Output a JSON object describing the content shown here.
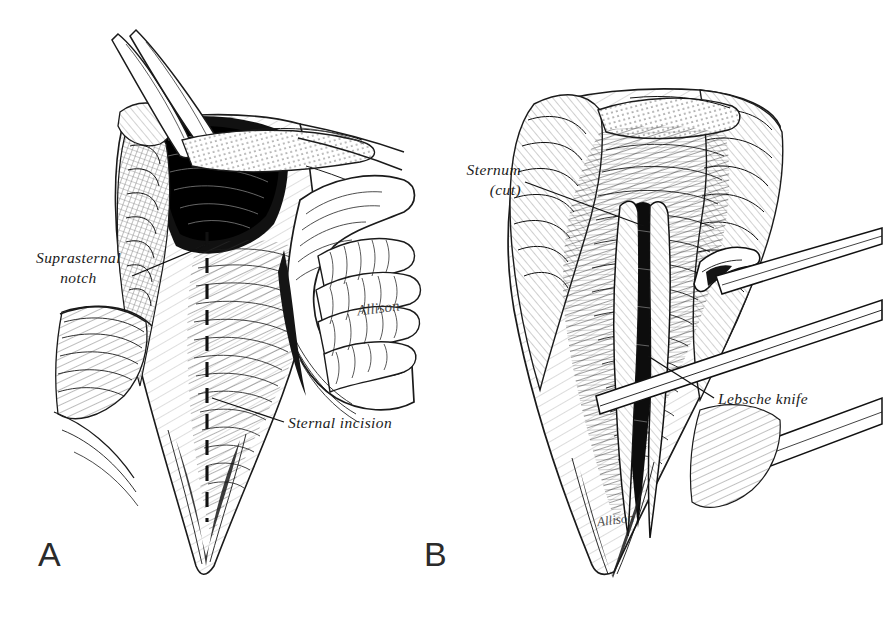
{
  "figure": {
    "medium": "pen-and-ink line drawing",
    "background_color": "#ffffff",
    "ink_color": "#1a1a1a",
    "panels": [
      {
        "letter": "A",
        "description": "Exposed sternum with surgeon's fist demonstrating blunt dissection of the retrosternal plane; dashed midline marks the planned sternal incision.",
        "annotations": [
          {
            "id": "suprasternal-notch",
            "text_lines": [
              "Suprasternal",
              "notch"
            ],
            "text": "Suprasternal notch"
          },
          {
            "id": "sternal-incision",
            "text_lines": [
              "Sternal  incision"
            ],
            "text": "Sternal incision"
          }
        ],
        "signature": "Allison"
      },
      {
        "letter": "B",
        "description": "Sternum divided in the midline with the Lebsche knife advancing beneath the sternum; wound edges retracted laterally.",
        "annotations": [
          {
            "id": "sternum-cut",
            "text_lines": [
              "Sternum",
              "(cut)"
            ],
            "text": "Sternum (cut)"
          },
          {
            "id": "lebsche-knife",
            "text_lines": [
              "Lebsche  knife"
            ],
            "text": "Lebsche knife"
          }
        ],
        "signature": "Allison"
      }
    ]
  },
  "labels": {
    "panel_a_letter": "A",
    "panel_b_letter": "B",
    "suprasternal_line1": "Suprasternal",
    "suprasternal_line2": "notch",
    "sternal_incision": "Sternal  incision",
    "sternum_line1": "Sternum",
    "sternum_line2": "(cut)",
    "lebsche_knife": "Lebsche  knife",
    "signature_a": "Allison",
    "signature_b": "Allison"
  }
}
